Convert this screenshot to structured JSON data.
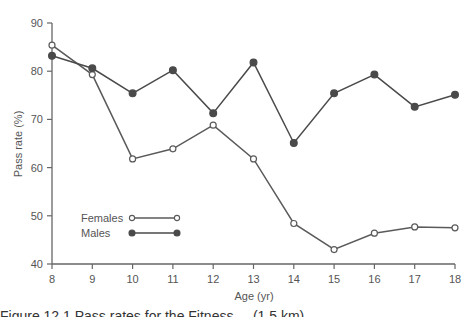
{
  "chart_data": {
    "type": "line",
    "title": "",
    "xlabel": "Age (yr)",
    "ylabel": "Pass rate (%)",
    "x": [
      8,
      9,
      10,
      11,
      12,
      13,
      14,
      15,
      16,
      17,
      18
    ],
    "xlim": [
      8,
      18
    ],
    "ylim": [
      40,
      90
    ],
    "xticks": [
      "8",
      "9",
      "10",
      "11",
      "12",
      "13",
      "14",
      "15",
      "16",
      "17",
      "18"
    ],
    "yticks": [
      "40",
      "50",
      "60",
      "70",
      "80",
      "90"
    ],
    "grid": false,
    "legend_position": "lower-left inside",
    "series": [
      {
        "name": "Females",
        "marker": "open-circle",
        "color": "#5a5a5a",
        "values": [
          85.4,
          79.3,
          61.8,
          63.9,
          68.8,
          61.8,
          48.4,
          43.0,
          46.4,
          47.7,
          47.5
        ]
      },
      {
        "name": "Males",
        "marker": "filled-circle",
        "color": "#4a4a4a",
        "values": [
          83.2,
          80.6,
          75.4,
          80.2,
          71.3,
          81.8,
          65.1,
          75.4,
          79.3,
          72.6,
          75.1
        ]
      }
    ]
  },
  "caption": "Figure 12.1   Pass rates for the Fitness ... (1.5 km)"
}
